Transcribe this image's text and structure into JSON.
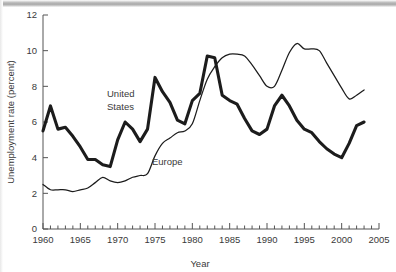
{
  "figure": {
    "caption_visible": false
  },
  "chart_data": {
    "type": "line",
    "title": "",
    "xlabel": "Year",
    "ylabel": "Unemployment rate (percent)",
    "xlim": [
      1960,
      2005
    ],
    "ylim": [
      0,
      12
    ],
    "grid": false,
    "legend": "inline-labels",
    "x_ticks_major": [
      1960,
      1965,
      1970,
      1975,
      1980,
      1985,
      1990,
      1995,
      2000,
      2005
    ],
    "x_tick_labels": [
      "1960",
      "1965",
      "1970",
      "1975",
      "1980",
      "1985",
      "1990",
      "1995",
      "2000",
      "2005"
    ],
    "x_minor_tick_step": 1,
    "y_ticks_major": [
      0,
      2,
      4,
      6,
      8,
      10,
      12
    ],
    "y_tick_labels": [
      "0",
      "2",
      "4",
      "6",
      "8",
      "10",
      "12"
    ],
    "series": [
      {
        "name": "United States",
        "label": "United States",
        "label_line1": "United",
        "label_line2": "States",
        "style": "thick",
        "color": "#1c1c1c",
        "x": [
          1960,
          1961,
          1962,
          1963,
          1964,
          1965,
          1966,
          1967,
          1968,
          1969,
          1970,
          1971,
          1972,
          1973,
          1974,
          1975,
          1976,
          1977,
          1978,
          1979,
          1980,
          1981,
          1982,
          1983,
          1984,
          1985,
          1986,
          1987,
          1988,
          1989,
          1990,
          1991,
          1992,
          1993,
          1994,
          1995,
          1996,
          1997,
          1998,
          1999,
          2000,
          2001,
          2002,
          2003
        ],
        "values": [
          5.5,
          6.9,
          5.6,
          5.7,
          5.2,
          4.6,
          3.9,
          3.9,
          3.6,
          3.5,
          5.0,
          6.0,
          5.6,
          4.9,
          5.6,
          8.5,
          7.7,
          7.1,
          6.1,
          5.9,
          7.2,
          7.6,
          9.7,
          9.6,
          7.5,
          7.2,
          7.0,
          6.2,
          5.5,
          5.3,
          5.6,
          6.9,
          7.5,
          6.9,
          6.1,
          5.6,
          5.4,
          4.9,
          4.5,
          4.2,
          4.0,
          4.8,
          5.8,
          6.0
        ]
      },
      {
        "name": "Europe",
        "label": "Europe",
        "style": "thin",
        "color": "#1c1c1c",
        "x": [
          1960,
          1961,
          1962,
          1963,
          1964,
          1965,
          1966,
          1967,
          1968,
          1969,
          1970,
          1971,
          1972,
          1973,
          1974,
          1975,
          1976,
          1977,
          1978,
          1979,
          1980,
          1981,
          1982,
          1983,
          1984,
          1985,
          1986,
          1987,
          1988,
          1989,
          1990,
          1991,
          1992,
          1993,
          1994,
          1995,
          1996,
          1997,
          1998,
          1999,
          2000,
          2001,
          2002,
          2003
        ],
        "values": [
          2.5,
          2.2,
          2.2,
          2.2,
          2.1,
          2.2,
          2.3,
          2.6,
          2.9,
          2.7,
          2.6,
          2.7,
          2.9,
          3.0,
          3.1,
          4.1,
          4.8,
          5.1,
          5.4,
          5.5,
          5.9,
          7.2,
          8.4,
          9.1,
          9.6,
          9.8,
          9.8,
          9.7,
          9.2,
          8.6,
          8.0,
          8.0,
          8.9,
          9.9,
          10.4,
          10.1,
          10.1,
          10.0,
          9.3,
          8.6,
          7.9,
          7.3,
          7.5,
          7.8
        ]
      }
    ],
    "annotations": [
      {
        "text": "United States",
        "x": 1969.5,
        "y": 7.3
      },
      {
        "text": "Europe",
        "x": 1976.5,
        "y": 3.9
      }
    ]
  }
}
